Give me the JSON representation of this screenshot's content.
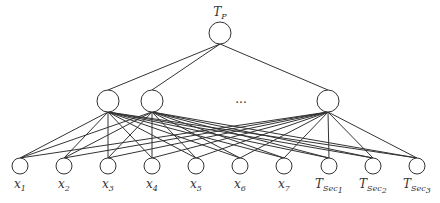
{
  "diagram": {
    "type": "neural-network-tree",
    "top_node": {
      "id": "TP",
      "label_main": "T",
      "label_sub": "P",
      "x": 220,
      "y": 33,
      "r": 11
    },
    "middle_nodes": [
      {
        "id": "h1",
        "x": 108,
        "y": 101,
        "r": 11
      },
      {
        "id": "h2",
        "x": 152,
        "y": 101,
        "r": 11
      },
      {
        "id": "hn",
        "x": 328,
        "y": 101,
        "r": 11
      }
    ],
    "ellipsis": {
      "text": "...",
      "x": 241,
      "y": 103
    },
    "bottom_nodes": [
      {
        "id": "x1",
        "label_main": "x",
        "label_sub": "1",
        "x": 20,
        "y": 166,
        "r": 8
      },
      {
        "id": "x2",
        "label_main": "x",
        "label_sub": "2",
        "x": 64,
        "y": 166,
        "r": 8
      },
      {
        "id": "x3",
        "label_main": "x",
        "label_sub": "3",
        "x": 108,
        "y": 166,
        "r": 8
      },
      {
        "id": "x4",
        "label_main": "x",
        "label_sub": "4",
        "x": 152,
        "y": 166,
        "r": 8
      },
      {
        "id": "x5",
        "label_main": "x",
        "label_sub": "5",
        "x": 196,
        "y": 166,
        "r": 8
      },
      {
        "id": "x6",
        "label_main": "x",
        "label_sub": "6",
        "x": 240,
        "y": 166,
        "r": 8
      },
      {
        "id": "x7",
        "label_main": "x",
        "label_sub": "7",
        "x": 284,
        "y": 166,
        "r": 8
      },
      {
        "id": "TSec1",
        "label_main": "T",
        "label_sub": "Sec",
        "label_subsub": "1",
        "x": 329,
        "y": 166,
        "r": 8
      },
      {
        "id": "TSec2",
        "label_main": "T",
        "label_sub": "Sec",
        "label_subsub": "2",
        "x": 373,
        "y": 166,
        "r": 8
      },
      {
        "id": "TSec3",
        "label_main": "T",
        "label_sub": "Sec",
        "label_subsub": "3",
        "x": 417,
        "y": 166,
        "r": 8
      }
    ],
    "connections": {
      "top_to_middle": "all",
      "middle_to_bottom": "all"
    }
  }
}
